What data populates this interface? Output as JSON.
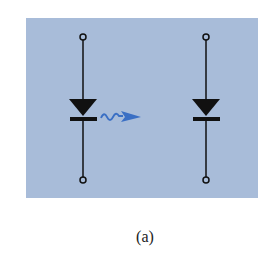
{
  "figure": {
    "caption": "(a)",
    "panel_color": "#a8bcd9",
    "line_color": "#111111",
    "arrow_color": "#3a6fc4"
  },
  "diagram": {
    "components": [
      {
        "id": "emitter-diode",
        "type": "diode",
        "role": "light-emitting diode",
        "orientation": "anode-top, cathode-bottom"
      },
      {
        "id": "receiver-diode",
        "type": "diode",
        "role": "photodiode",
        "orientation": "anode-top, cathode-bottom"
      }
    ],
    "connections": [
      {
        "from": "emitter-diode",
        "to": "receiver-diode",
        "type": "optical-signal",
        "symbol": "wavy-arrow"
      }
    ],
    "terminals": 4
  }
}
